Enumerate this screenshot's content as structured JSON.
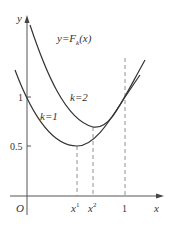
{
  "diagram": {
    "function_label": {
      "prefix": "y=F",
      "sub": "k",
      "suffix": "(x)"
    },
    "axes": {
      "x_label": "x",
      "y_label": "y",
      "origin_label": "O"
    },
    "y_ticks": [
      {
        "label": "1"
      },
      {
        "label": "0.5"
      }
    ],
    "x_ticks": [
      {
        "label": "x",
        "sup": "1"
      },
      {
        "label": "x",
        "sup": "2"
      },
      {
        "label": "1"
      }
    ],
    "curves": [
      {
        "name": "k=2",
        "label": "k=2"
      },
      {
        "name": "k=1",
        "label": "k=1"
      }
    ]
  }
}
